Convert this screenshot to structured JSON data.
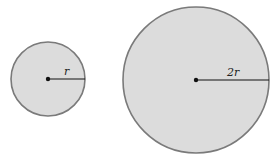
{
  "diagram": {
    "fill_color": "#dcdcdc",
    "stroke_color": "#7a7a7a",
    "circles": [
      {
        "id": "small",
        "cx": 48,
        "cy": 79,
        "r": 37,
        "radius_label": "r"
      },
      {
        "id": "large",
        "cx": 196,
        "cy": 80,
        "r": 73,
        "radius_label": "2r"
      }
    ]
  }
}
